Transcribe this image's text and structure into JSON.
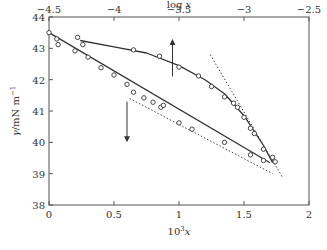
{
  "chart_data": {
    "type": "scatter",
    "title": "",
    "xlabel": "10³x",
    "xlabel_base": "10",
    "xlabel_sup": "3",
    "xlabel_var": "x",
    "x2label": "log x",
    "ylabel": "γ/mN m⁻¹",
    "xlim": [
      0,
      2
    ],
    "x2lim": [
      -4.5,
      -2.5
    ],
    "ylim": [
      38,
      44
    ],
    "xticks": [
      "0",
      "0.5",
      "1",
      "1.5",
      "2"
    ],
    "xtick_values": [
      0,
      0.5,
      1,
      1.5,
      2
    ],
    "x2ticks": [
      "−4.5",
      "−4",
      "−3.5",
      "−3",
      "−2.5"
    ],
    "x2tick_values": [
      -4.5,
      -4,
      -3.5,
      -3,
      -2.5
    ],
    "yticks": [
      "38",
      "39",
      "40",
      "41",
      "42",
      "43",
      "44"
    ],
    "ytick_values": [
      38,
      39,
      40,
      41,
      42,
      43,
      44
    ],
    "grid": false,
    "series": [
      {
        "name": "γ vs 10³x (lower axis)",
        "axis": "bottom",
        "marker": "open-circle",
        "points": [
          [
            0.0,
            43.5
          ],
          [
            0.06,
            43.3
          ],
          [
            0.07,
            43.12
          ],
          [
            0.2,
            42.92
          ],
          [
            0.3,
            42.72
          ],
          [
            0.4,
            42.38
          ],
          [
            0.5,
            42.15
          ],
          [
            0.6,
            41.85
          ],
          [
            0.65,
            41.6
          ],
          [
            0.73,
            41.42
          ],
          [
            0.8,
            41.28
          ],
          [
            0.86,
            41.12
          ],
          [
            0.88,
            41.18
          ],
          [
            1.0,
            40.62
          ],
          [
            1.1,
            40.42
          ],
          [
            1.35,
            40.0
          ],
          [
            1.55,
            39.6
          ],
          [
            1.65,
            39.42
          ]
        ],
        "fit_line": [
          [
            0.0,
            43.5
          ],
          [
            1.7,
            39.35
          ]
        ],
        "arrow": {
          "direction": "down",
          "at_x": 0.6,
          "from_y": 41.3,
          "to_y": 40.1
        }
      },
      {
        "name": "γ vs log x (upper axis)",
        "axis": "top",
        "marker": "open-circle",
        "points": [
          [
            -4.28,
            43.35
          ],
          [
            -4.24,
            43.12
          ],
          [
            -3.85,
            42.95
          ],
          [
            -3.65,
            42.75
          ],
          [
            -3.5,
            42.4
          ],
          [
            -3.35,
            42.12
          ],
          [
            -3.25,
            41.78
          ],
          [
            -3.15,
            41.45
          ],
          [
            -3.08,
            41.25
          ],
          [
            -3.05,
            41.12
          ],
          [
            -3.0,
            40.8
          ],
          [
            -2.95,
            40.45
          ],
          [
            -2.92,
            40.28
          ],
          [
            -2.85,
            39.78
          ],
          [
            -2.78,
            39.52
          ],
          [
            -2.76,
            39.38
          ]
        ],
        "fit_curve": [
          [
            -4.26,
            43.25
          ],
          [
            -4.0,
            43.05
          ],
          [
            -3.75,
            42.85
          ],
          [
            -3.5,
            42.45
          ],
          [
            -3.3,
            42.0
          ],
          [
            -3.15,
            41.55
          ],
          [
            -3.0,
            40.85
          ],
          [
            -2.85,
            39.9
          ],
          [
            -2.78,
            39.35
          ]
        ],
        "arrow": {
          "direction": "up",
          "at_log_x": -3.55,
          "from_y": 42.1,
          "to_y": 43.2
        }
      }
    ],
    "reference_lines": [
      {
        "name": "tangent-upper",
        "style": "dotted",
        "axis": "top",
        "from": [
          -3.26,
          42.8
        ],
        "to": [
          -2.7,
          38.85
        ]
      },
      {
        "name": "tangent-lower",
        "style": "dotted",
        "axis": "bottom",
        "from": [
          0.62,
          41.4
        ],
        "to": [
          1.72,
          39.0
        ]
      }
    ]
  }
}
